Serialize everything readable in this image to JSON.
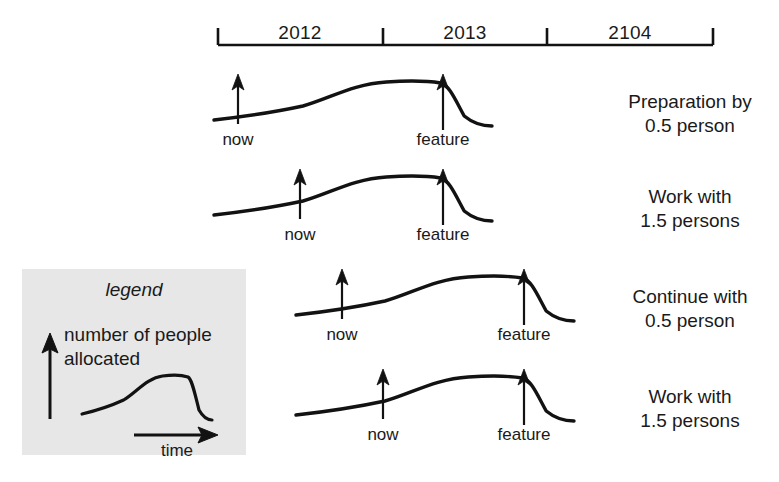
{
  "diagram": {
    "timeline": {
      "axis_y": 45,
      "x_start": 218,
      "x_end": 713,
      "ticks": [
        218,
        383,
        547,
        713
      ],
      "segments": [
        {
          "label": "2012",
          "center_x": 300,
          "label_y": 22
        },
        {
          "label": "2013",
          "center_x": 465,
          "label_y": 22
        },
        {
          "label": "2104",
          "center_x": 630,
          "label_y": 22
        }
      ]
    },
    "rows": [
      {
        "id": "row-preparation",
        "top": 68,
        "curve_start_x": 214,
        "curve_end_x": 492,
        "now_x": 238,
        "feature_x": 443,
        "now_label": "now",
        "feature_label": "feature",
        "caption_line1": "Preparation by",
        "caption_line2": "0.5 person",
        "caption_x": 690,
        "caption_y": 22
      },
      {
        "id": "row-work-1",
        "top": 163,
        "curve_start_x": 214,
        "curve_end_x": 492,
        "now_x": 300,
        "feature_x": 443,
        "now_label": "now",
        "feature_label": "feature",
        "caption_line1": "Work with",
        "caption_line2": "1.5 persons",
        "caption_x": 690,
        "caption_y": 22
      },
      {
        "id": "row-continue",
        "top": 263,
        "curve_start_x": 296,
        "curve_end_x": 574,
        "now_x": 342,
        "feature_x": 524,
        "now_label": "now",
        "feature_label": "feature",
        "caption_line1": "Continue with",
        "caption_line2": "0.5 person",
        "caption_x": 690,
        "caption_y": 22
      },
      {
        "id": "row-work-2",
        "top": 363,
        "curve_start_x": 296,
        "curve_end_x": 574,
        "now_x": 383,
        "feature_x": 524,
        "now_label": "now",
        "feature_label": "feature",
        "caption_line1": "Work with",
        "caption_line2": "1.5 persons",
        "caption_x": 690,
        "caption_y": 22
      }
    ],
    "legend": {
      "title": "legend",
      "axis_y_label_line1": "number of people",
      "axis_y_label_line2": "allocated",
      "axis_x_label": "time",
      "box": {
        "x": 22,
        "y": 269,
        "width": 224,
        "height": 186
      },
      "background_color": "#e7e7e7"
    },
    "colors": {
      "ink": "#121212",
      "page_background": "#ffffff",
      "legend_background": "#e7e7e7"
    }
  }
}
